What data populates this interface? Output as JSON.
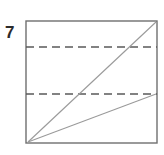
{
  "figure": {
    "label": "7",
    "label_position": {
      "x": 5,
      "y": 33
    },
    "canvas": {
      "width": 164,
      "height": 155
    },
    "background_color": "#ffffff",
    "stroke_color": "#6f6f6f",
    "dash_color": "#5a5a5a",
    "diagonal_color": "#9a9a9a",
    "label_color": "#2b2b2b",
    "rectangle": {
      "name": "outer-rectangle",
      "x": 26,
      "y": 21,
      "width": 131,
      "height": 122,
      "left": 26,
      "top": 21,
      "right": 157,
      "bottom": 143,
      "stroke_width": 1.4
    },
    "dashed_lines": [
      {
        "name": "upper-dashed-line",
        "x1": 26,
        "y1": 47,
        "x2": 157,
        "y2": 47,
        "dash_pattern": "8 5",
        "stroke_width": 1.5
      },
      {
        "name": "lower-dashed-line",
        "x1": 26,
        "y1": 94,
        "x2": 157,
        "y2": 94,
        "dash_pattern": "8 5",
        "stroke_width": 1.5
      }
    ],
    "diagonals": [
      {
        "name": "main-diagonal",
        "x1": 28,
        "y1": 142,
        "x2": 156,
        "y2": 22,
        "stroke_width": 1.1
      },
      {
        "name": "shallow-diagonal",
        "x1": 28,
        "y1": 142,
        "x2": 156,
        "y2": 94,
        "stroke_width": 1.1
      }
    ]
  }
}
